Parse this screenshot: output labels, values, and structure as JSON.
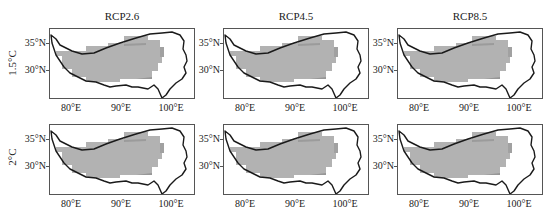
{
  "figure": {
    "columns": [
      "RCP2.6",
      "RCP4.5",
      "RCP8.5"
    ],
    "rows": [
      "1.5°C",
      "2°C"
    ],
    "y_ticks": [
      "35°N",
      "30°N"
    ],
    "x_ticks": [
      "80°E",
      "90°E",
      "100°E"
    ]
  },
  "colors": {
    "fill": "#b2b2b2",
    "fill_dark": "#8c8c8c",
    "outline": "#1a1a1a",
    "frame": "#555555"
  },
  "panels": [
    {
      "row": "1.5°C",
      "column": "RCP2.6"
    },
    {
      "row": "1.5°C",
      "column": "RCP4.5"
    },
    {
      "row": "1.5°C",
      "column": "RCP8.5"
    },
    {
      "row": "2°C",
      "column": "RCP2.6"
    },
    {
      "row": "2°C",
      "column": "RCP4.5"
    },
    {
      "row": "2°C",
      "column": "RCP8.5"
    }
  ]
}
